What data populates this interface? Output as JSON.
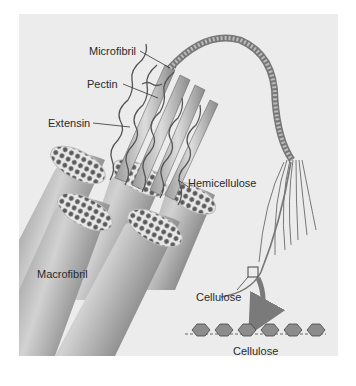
{
  "figure": {
    "background": "#ececec",
    "labels": {
      "microfibril": "Microfibril",
      "pectin": "Pectin",
      "extensin": "Extensin",
      "hemicellulose": "Hemicellulose",
      "macrofibril": "Macrofibril",
      "cellulose_fiber": "Cellulose",
      "cellulose_chain": "Cellulose"
    },
    "colors": {
      "fibril_dark": "#6e6e6e",
      "fibril_light": "#c8c8c8",
      "strand": "#555555",
      "arrow": "#7a7a7a"
    }
  }
}
